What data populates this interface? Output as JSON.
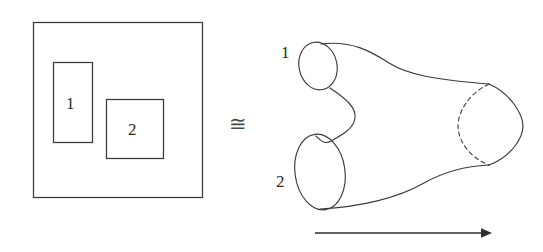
{
  "figure": {
    "background_color": "#ffffff",
    "line_color": "#3a3a3a",
    "width": 543,
    "height": 252,
    "relation_symbol": "≅",
    "left_panel": {
      "description": "square-with-two-rectangular-holes",
      "outer_square_label": "",
      "holes": [
        {
          "label": "1",
          "shape": "rectangle"
        },
        {
          "label": "2",
          "shape": "square"
        }
      ]
    },
    "right_panel": {
      "description": "pair-of-pants-surface",
      "boundary_labels": [
        {
          "label": "1",
          "position": "upper-left"
        },
        {
          "label": "2",
          "position": "lower-left"
        }
      ],
      "arrow": {
        "direction": "right",
        "label": ""
      }
    }
  }
}
